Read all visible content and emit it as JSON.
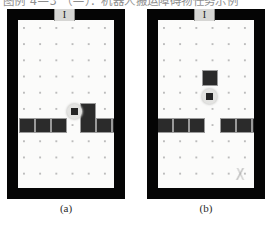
{
  "scan": {
    "clipped_header_text": "图例 4—3 （—）：机器人搬运障碍物任务示例",
    "smudge_present": true
  },
  "figure": {
    "caption_a": "(a)",
    "caption_b": "(b)",
    "panels": [
      {
        "id": "a",
        "caption": "(a)",
        "door_label": "I",
        "grid": {
          "cols": 6,
          "rows": 10,
          "dot_color": "#b9b9b9"
        },
        "robot": {
          "x": 49,
          "y": 84,
          "label": "robot"
        },
        "blocks": [
          {
            "x": 1,
            "y": 98,
            "w": 16,
            "h": 15
          },
          {
            "x": 17,
            "y": 98,
            "w": 16,
            "h": 15
          },
          {
            "x": 33,
            "y": 98,
            "w": 16,
            "h": 15
          },
          {
            "x": 62,
            "y": 83,
            "w": 16,
            "h": 30
          },
          {
            "x": 78,
            "y": 98,
            "w": 16,
            "h": 15
          },
          {
            "x": 94,
            "y": 98,
            "w": 16,
            "h": 15
          }
        ]
      },
      {
        "id": "b",
        "caption": "(b)",
        "door_label": "I",
        "grid": {
          "cols": 6,
          "rows": 10,
          "dot_color": "#b9b9b9"
        },
        "robot": {
          "x": 44,
          "y": 69,
          "label": "robot"
        },
        "blocks": [
          {
            "x": 44,
            "y": 50,
            "w": 16,
            "h": 16
          },
          {
            "x": -1,
            "y": 98,
            "w": 16,
            "h": 15
          },
          {
            "x": 15,
            "y": 98,
            "w": 16,
            "h": 15
          },
          {
            "x": 31,
            "y": 98,
            "w": 16,
            "h": 15
          },
          {
            "x": 62,
            "y": 98,
            "w": 16,
            "h": 15
          },
          {
            "x": 78,
            "y": 98,
            "w": 16,
            "h": 15
          },
          {
            "x": 94,
            "y": 98,
            "w": 16,
            "h": 15
          }
        ]
      }
    ]
  },
  "colors": {
    "wall": "#050505",
    "floor": "#fbfbfa",
    "block": "#2b2b2b",
    "block_border": "#9a9a9a",
    "robot_core": "#252525",
    "robot_halo": "#e3e3e1",
    "door": "#d6d6d4"
  }
}
